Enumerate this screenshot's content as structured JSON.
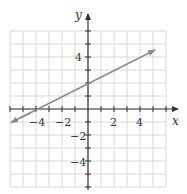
{
  "chart_data": {
    "type": "line",
    "title": "",
    "xlabel": "x",
    "ylabel": "y",
    "xlim": [
      -6,
      6
    ],
    "ylim": [
      -6,
      6
    ],
    "grid": true,
    "x_ticks": [
      -4,
      -2,
      2,
      4
    ],
    "y_ticks": [
      4,
      -2,
      -4
    ],
    "series": [
      {
        "name": "line",
        "equation": "y = 0.5x + 2",
        "x": [
          -6,
          -4,
          0,
          6
        ],
        "y": [
          -1,
          0,
          2,
          5
        ],
        "color": "#8a8a8a",
        "arrows": "both"
      }
    ]
  },
  "labels": {
    "x_axis": "x",
    "y_axis": "y",
    "tick_neg4x": "−4",
    "tick_neg2x": "−2",
    "tick_2x": "2",
    "tick_4x": "4",
    "tick_4y": "4",
    "tick_neg2y": "−2",
    "tick_neg4y": "−4"
  },
  "colors": {
    "grid": "#d8d8d8",
    "axis": "#333333",
    "line": "#8a8a8a"
  }
}
